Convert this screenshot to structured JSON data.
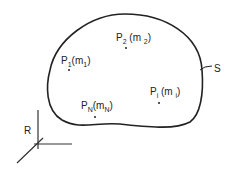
{
  "diagram": {
    "body_label": "S",
    "frame_label": "R",
    "particles": [
      {
        "name": "P",
        "sub": "1",
        "mass": "m",
        "mass_sub": "1"
      },
      {
        "name": "P",
        "sub": "2",
        "mass": "m",
        "mass_sub": "2"
      },
      {
        "name": "P",
        "sub": "i",
        "mass": "m",
        "mass_sub": "i"
      },
      {
        "name": "P",
        "sub": "N",
        "mass": "m",
        "mass_sub": "N"
      }
    ],
    "colors": {
      "stroke": "#222222",
      "background": "#ffffff"
    }
  }
}
